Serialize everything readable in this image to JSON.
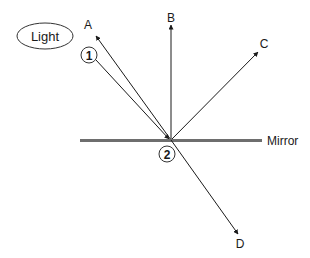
{
  "diagram": {
    "light_label": "Light",
    "mirror_label": "Mirror",
    "markers": {
      "one": "1",
      "two": "2"
    },
    "rays": {
      "a": {
        "label": "A"
      },
      "b": {
        "label": "B"
      },
      "c": {
        "label": "C"
      },
      "d": {
        "label": "D"
      }
    },
    "colors": {
      "line": "#1a1a1a",
      "mirror": "#6e6e6e",
      "background": "#ffffff"
    }
  }
}
